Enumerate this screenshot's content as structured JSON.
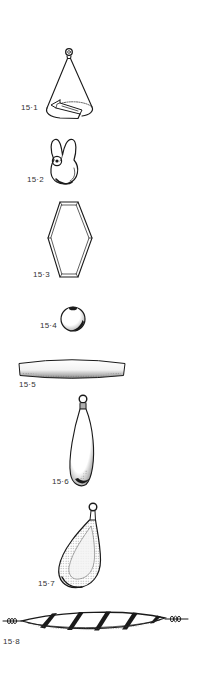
{
  "plate": {
    "background": "#ffffff",
    "ink_color": "#1a1a1a",
    "label_color": "#333333"
  },
  "figures": [
    {
      "label": "15·1",
      "illustration": "cone-sinker-with-slot"
    },
    {
      "label": "15·2",
      "illustration": "split-lobed-sinker-with-eye"
    },
    {
      "label": "15·3",
      "illustration": "hexagonal-frame-sinker"
    },
    {
      "label": "15·4",
      "illustration": "round-ball-sinker"
    },
    {
      "label": "15·5",
      "illustration": "flat-bar-sinker"
    },
    {
      "label": "15·6",
      "illustration": "slim-teardrop-sinker-with-eye"
    },
    {
      "label": "15·7",
      "illustration": "pear-sinker-with-eye"
    },
    {
      "label": "15·8",
      "illustration": "spiral-twisted-sinker-with-wire-ends"
    }
  ]
}
